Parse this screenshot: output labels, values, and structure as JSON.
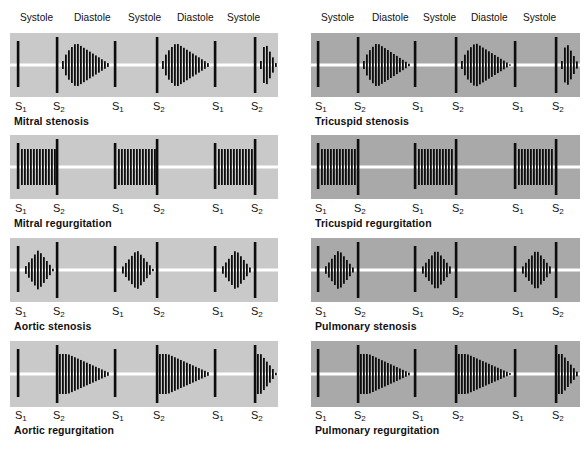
{
  "colors": {
    "left_panel_bg": "#c9c9c9",
    "right_panel_bg": "#a9a9a9",
    "baseline": "#ffffff",
    "ink": "#0d0d0d"
  },
  "headers": {
    "left": [
      "Systole",
      "Diastole",
      "Systole",
      "Diastole",
      "Systole"
    ],
    "right": [
      "Systole",
      "Diastole",
      "Systole",
      "Diastole",
      "Systole"
    ]
  },
  "sound_labels": {
    "s1_base": "S",
    "s1_sub": "1",
    "s2_base": "S",
    "s2_sub": "2"
  },
  "panels": [
    {
      "id": "mitral-stenosis",
      "title": "Mitral stenosis",
      "column": "left",
      "murmur": "diastolic-rumble-decrescendo"
    },
    {
      "id": "tricuspid-stenosis",
      "title": "Tricuspid stenosis",
      "column": "right",
      "murmur": "diastolic-rumble-decrescendo"
    },
    {
      "id": "mitral-regurgitation",
      "title": "Mitral regurgitation",
      "column": "left",
      "murmur": "holosystolic-plateau"
    },
    {
      "id": "tricuspid-regurgitation",
      "title": "Tricuspid regurgitation",
      "column": "right",
      "murmur": "holosystolic-plateau"
    },
    {
      "id": "aortic-stenosis",
      "title": "Aortic stenosis",
      "column": "left",
      "murmur": "systolic-crescendo-decrescendo"
    },
    {
      "id": "pulmonary-stenosis",
      "title": "Pulmonary stenosis",
      "column": "right",
      "murmur": "systolic-crescendo-decrescendo"
    },
    {
      "id": "aortic-regurgitation",
      "title": "Aortic regurgitation",
      "column": "left",
      "murmur": "early-diastolic-decrescendo"
    },
    {
      "id": "pulmonary-regurgitation",
      "title": "Pulmonary regurgitation",
      "column": "right",
      "murmur": "early-diastolic-decrescendo"
    }
  ]
}
